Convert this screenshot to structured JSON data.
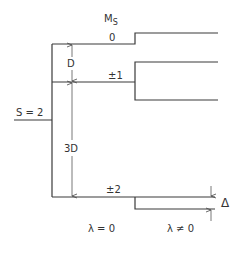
{
  "diagram": {
    "type": "energy-level-splitting",
    "header": {
      "label": "M",
      "subscript": "S"
    },
    "state_label": "S = 2",
    "levels": [
      {
        "label": "0"
      },
      {
        "label": "±1"
      },
      {
        "label": "±2"
      }
    ],
    "spacings": [
      {
        "label": "D",
        "between": [
          "0",
          "±1"
        ]
      },
      {
        "label": "3D",
        "between": [
          "±1",
          "±2"
        ]
      }
    ],
    "splitting_label": "Δ",
    "columns": [
      {
        "label": "λ = 0"
      },
      {
        "label": "λ ≠ 0"
      }
    ],
    "colors": {
      "line": "#3a3a3a",
      "text": "#333333",
      "background": "#ffffff"
    }
  }
}
